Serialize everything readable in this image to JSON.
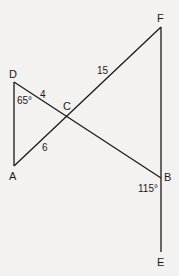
{
  "diagram": {
    "points": {
      "D": {
        "label": "D",
        "x": 14,
        "y": 82
      },
      "A": {
        "label": "A",
        "x": 14,
        "y": 166
      },
      "C": {
        "label": "C",
        "x": 67,
        "y": 115
      },
      "F": {
        "label": "F",
        "x": 161,
        "y": 27
      },
      "B": {
        "label": "B",
        "x": 161,
        "y": 178
      },
      "E": {
        "label": "E",
        "x": 161,
        "y": 252
      }
    },
    "segments": [
      "DA",
      "DB",
      "AF",
      "FE"
    ],
    "measures": {
      "DC": "4",
      "CA": "6",
      "CF": "15",
      "angle_D": "65°",
      "angle_B": "115°"
    }
  }
}
